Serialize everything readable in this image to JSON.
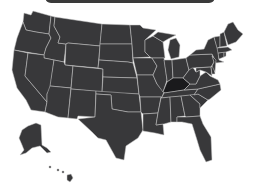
{
  "map": {
    "title": "United States",
    "fill_color": "#38383a",
    "border_color": "#c8c8c8",
    "highlight_color": "#1a1a1c",
    "highlighted_states": [
      "Kentucky"
    ],
    "states": [
      "Washington",
      "Oregon",
      "California",
      "Idaho",
      "Nevada",
      "Montana",
      "Wyoming",
      "Utah",
      "Arizona",
      "Colorado",
      "New Mexico",
      "North Dakota",
      "South Dakota",
      "Nebraska",
      "Kansas",
      "Oklahoma",
      "Texas",
      "Minnesota",
      "Iowa",
      "Missouri",
      "Arkansas",
      "Louisiana",
      "Wisconsin",
      "Illinois",
      "Michigan",
      "Indiana",
      "Ohio",
      "Kentucky",
      "Tennessee",
      "Mississippi",
      "Alabama",
      "Georgia",
      "Florida",
      "South Carolina",
      "North Carolina",
      "Virginia",
      "West Virginia",
      "Pennsylvania",
      "New York",
      "Maryland",
      "Delaware",
      "New Jersey",
      "Connecticut",
      "Rhode Island",
      "Massachusetts",
      "Vermont",
      "New Hampshire",
      "Maine",
      "Alaska",
      "Hawaii"
    ]
  }
}
